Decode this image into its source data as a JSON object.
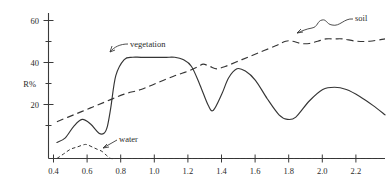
{
  "chart_data": {
    "type": "line",
    "title": "",
    "subtitle": "",
    "xlabel": "",
    "ylabel": "R%",
    "xlim": [
      0.35,
      2.35
    ],
    "ylim": [
      0,
      65
    ],
    "grid": false,
    "legend_position": "inline-annotations",
    "xticks": [
      "0.4",
      "0.6",
      "0.8",
      "1.0",
      "1.2",
      "1.4",
      "1.6",
      "1.8",
      "2.0",
      "2.2"
    ],
    "xtick_values": [
      0.4,
      0.6,
      0.8,
      1.0,
      1.2,
      1.4,
      1.6,
      1.8,
      2.0,
      2.2
    ],
    "yticks": [
      "20",
      "40",
      "60"
    ],
    "ytick_values": [
      20,
      40,
      60
    ],
    "yminor_values": [
      10,
      30,
      50
    ],
    "annotations": [
      {
        "label": "vegetation",
        "points_to_series": "vegetation"
      },
      {
        "label": "soil",
        "points_to_series": "soil"
      },
      {
        "label": "water",
        "points_to_series": "water"
      }
    ],
    "series": [
      {
        "name": "vegetation",
        "style": "solid",
        "x": [
          0.4,
          0.45,
          0.5,
          0.55,
          0.6,
          0.65,
          0.68,
          0.7,
          0.72,
          0.75,
          0.8,
          0.85,
          0.9,
          1.0,
          1.05,
          1.1,
          1.15,
          1.2,
          1.25,
          1.3,
          1.33,
          1.38,
          1.42,
          1.47,
          1.52,
          1.58,
          1.65,
          1.72,
          1.77,
          1.82,
          1.9,
          1.98,
          2.05,
          2.12,
          2.2,
          2.28,
          2.35
        ],
        "y": [
          7,
          9,
          14,
          17,
          15,
          11,
          11,
          14,
          22,
          36,
          43,
          44,
          44,
          44,
          44,
          44,
          43,
          40,
          32,
          23,
          21,
          28,
          35,
          39,
          38,
          34,
          26,
          19,
          17,
          18,
          25,
          30,
          31,
          30,
          27,
          23,
          19
        ]
      },
      {
        "name": "soil",
        "style": "long-dash",
        "x": [
          0.4,
          0.5,
          0.6,
          0.7,
          0.8,
          0.9,
          1.0,
          1.1,
          1.18,
          1.24,
          1.27,
          1.31,
          1.35,
          1.4,
          1.5,
          1.6,
          1.7,
          1.76,
          1.8,
          1.85,
          1.9,
          1.95,
          2.0,
          2.05,
          2.1,
          2.18,
          2.26,
          2.35
        ],
        "y": [
          16,
          19,
          22,
          25,
          28,
          30,
          33,
          36,
          38,
          40,
          41,
          40,
          39,
          40,
          43,
          46,
          49,
          51,
          51,
          50,
          50,
          51,
          52,
          52,
          52,
          51,
          51,
          52
        ]
      },
      {
        "name": "water",
        "style": "short-dash",
        "x": [
          0.4,
          0.44,
          0.48,
          0.52,
          0.56,
          0.58,
          0.61,
          0.64,
          0.67,
          0.7,
          0.72,
          0.75,
          0.8,
          0.9,
          1.0,
          1.2,
          1.4,
          1.6,
          1.8,
          2.0,
          2.2,
          2.35
        ],
        "y": [
          0,
          2,
          4,
          5,
          6,
          6,
          5,
          4,
          3,
          1,
          0,
          0,
          0,
          0,
          0,
          0,
          0,
          0,
          0,
          0,
          0,
          0
        ]
      }
    ]
  }
}
